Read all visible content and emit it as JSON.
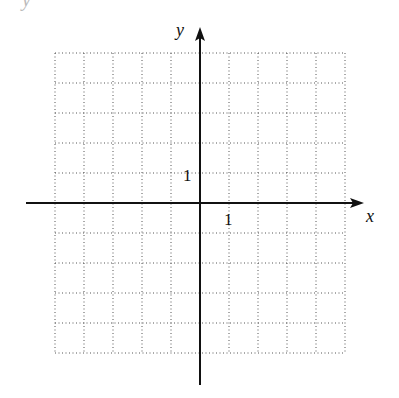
{
  "diagram": {
    "type": "coordinate-grid",
    "x_axis_label": "x",
    "y_axis_label": "y",
    "x_tick_label": "1",
    "y_tick_label": "1",
    "grid": {
      "columns": 10,
      "rows": 10,
      "x_range": [
        -5,
        5
      ],
      "y_range": [
        -5,
        5
      ],
      "style": "dotted"
    },
    "top_fragment_label": "y",
    "colors": {
      "axis": "#111111",
      "grid": "#555555",
      "background": "#ffffff"
    }
  }
}
